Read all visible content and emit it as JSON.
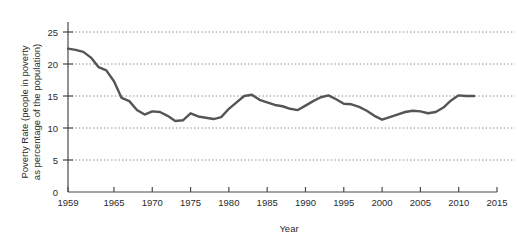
{
  "chart_data": {
    "type": "line",
    "title": "",
    "xlabel": "Year",
    "ylabel": "Poverty Rate (people in poverty as percentage of the population)",
    "ylabel_line1": "Poverty Rate (people in poverty",
    "ylabel_line2": "as percentage of the population)",
    "xlim": [
      1959,
      2015
    ],
    "ylim": [
      0,
      25
    ],
    "grid": "horizontal-dotted",
    "legend": "none",
    "line_color": "#555555",
    "axis_color": "#4a4a4a",
    "grid_color": "#8c8c8c",
    "xticks": [
      1959,
      1965,
      1970,
      1975,
      1980,
      1985,
      1990,
      1995,
      2000,
      2005,
      2010,
      2015
    ],
    "xtick_labels": [
      "1959",
      "1965",
      "1970",
      "1975",
      "1980",
      "1985",
      "1990",
      "1995",
      "2000",
      "2005",
      "2010",
      "2015"
    ],
    "yticks": [
      0,
      5,
      10,
      15,
      20,
      25
    ],
    "ytick_labels": [
      "0",
      "5",
      "10",
      "15",
      "20",
      "25"
    ],
    "series": [
      {
        "name": "Poverty Rate",
        "x": [
          1959,
          1960,
          1961,
          1962,
          1963,
          1964,
          1965,
          1966,
          1967,
          1968,
          1969,
          1970,
          1971,
          1972,
          1973,
          1974,
          1975,
          1976,
          1977,
          1978,
          1979,
          1980,
          1981,
          1982,
          1983,
          1984,
          1985,
          1986,
          1987,
          1988,
          1989,
          1990,
          1991,
          1992,
          1993,
          1994,
          1995,
          1996,
          1997,
          1998,
          1999,
          2000,
          2001,
          2002,
          2003,
          2004,
          2005,
          2006,
          2007,
          2008,
          2009,
          2010,
          2011,
          2012
        ],
        "values": [
          22.4,
          22.2,
          21.9,
          21.0,
          19.5,
          19.0,
          17.3,
          14.7,
          14.2,
          12.8,
          12.1,
          12.6,
          12.5,
          11.9,
          11.1,
          11.2,
          12.3,
          11.8,
          11.6,
          11.4,
          11.7,
          13.0,
          14.0,
          15.0,
          15.2,
          14.4,
          14.0,
          13.6,
          13.4,
          13.0,
          12.8,
          13.5,
          14.2,
          14.8,
          15.1,
          14.5,
          13.8,
          13.7,
          13.3,
          12.7,
          11.9,
          11.3,
          11.7,
          12.1,
          12.5,
          12.7,
          12.6,
          12.3,
          12.5,
          13.2,
          14.3,
          15.1,
          15.0,
          15.0
        ]
      }
    ]
  }
}
